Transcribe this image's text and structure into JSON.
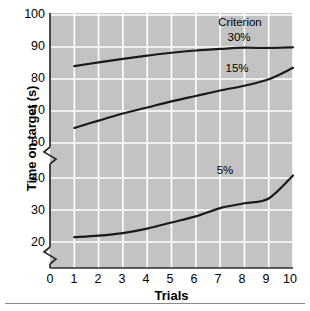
{
  "chart_data": {
    "type": "line",
    "title": "",
    "xlabel": "Trials",
    "ylabel": "Time on target (s)",
    "xlim": [
      0,
      10
    ],
    "ylim": [
      15,
      100
    ],
    "xticks": [
      0,
      1,
      2,
      3,
      4,
      5,
      6,
      7,
      8,
      9,
      10
    ],
    "yticks": [
      20,
      30,
      40,
      60,
      70,
      80,
      90,
      100
    ],
    "y_axis_break": true,
    "y_axis_break_note": "axis break between 40 and 60, and below 20",
    "grid": true,
    "grid_color": "#ffffff",
    "plot_background": "#c3c3c3",
    "line_color": "#1a1a1a",
    "legend_position": "inline-annotations",
    "x": [
      1,
      2,
      3,
      4,
      5,
      6,
      7,
      8,
      9,
      10
    ],
    "series": [
      {
        "name": "30%",
        "label": "30%",
        "values": [
          84.0,
          85.2,
          86.3,
          87.3,
          88.2,
          88.9,
          89.4,
          89.8,
          89.7,
          89.9
        ]
      },
      {
        "name": "15%",
        "label": "15%",
        "values": [
          64.7,
          67.0,
          69.2,
          71.1,
          73.0,
          74.7,
          76.4,
          77.9,
          79.9,
          83.5
        ]
      },
      {
        "name": "5%",
        "label": "5%",
        "values": [
          21.5,
          22.0,
          22.8,
          24.2,
          26.1,
          28.0,
          30.6,
          32.1,
          33.6,
          40.8
        ]
      }
    ],
    "annotations": [
      {
        "text": "Criterion",
        "name": "criterion-label"
      },
      {
        "text": "30%",
        "name": "series-30-label"
      },
      {
        "text": "15%",
        "name": "series-15-label"
      },
      {
        "text": "5%",
        "name": "series-5-label"
      }
    ]
  },
  "axes": {
    "y_title": "Time on target (s)",
    "x_title": "Trials",
    "y_tick_labels": [
      "100",
      "90",
      "80",
      "70",
      "60",
      "40",
      "30",
      "20"
    ],
    "x_tick_labels": [
      "0",
      "1",
      "2",
      "3",
      "4",
      "5",
      "6",
      "7",
      "8",
      "9",
      "10"
    ]
  },
  "annotations": {
    "criterion": "Criterion",
    "pct30": "30%",
    "pct15": "15%",
    "pct5": "5%"
  }
}
